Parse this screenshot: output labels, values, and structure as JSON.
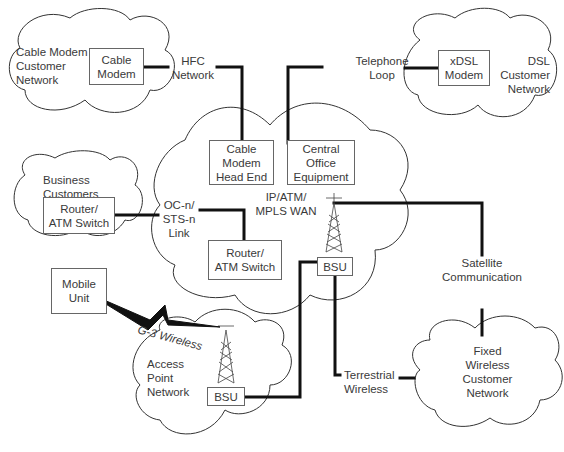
{
  "diagram": {
    "clouds": {
      "cable_modem_customer": {
        "label": [
          "Cable Modem",
          "Customer",
          "Network"
        ]
      },
      "dsl_customer": {
        "label": [
          "DSL",
          "Customer",
          "Network"
        ]
      },
      "business_customers": {
        "label": [
          "Business",
          "Customers"
        ]
      },
      "core_wan": {
        "label": [
          "IP/ATM/",
          "MPLS WAN"
        ]
      },
      "access_point": {
        "label": [
          "Access",
          "Point",
          "Network"
        ]
      },
      "fixed_wireless": {
        "label": [
          "Fixed",
          "Wireless",
          "Customer",
          "Network"
        ]
      }
    },
    "boxes": {
      "cable_modem": [
        "Cable",
        "Modem"
      ],
      "xdsl_modem": [
        "xDSL",
        "Modem"
      ],
      "cmts": [
        "Cable",
        "Modem",
        "Head End"
      ],
      "central_office": [
        "Central",
        "Office",
        "Equipment"
      ],
      "business_router": [
        "Router/",
        "ATM Switch"
      ],
      "core_router": [
        "Router/",
        "ATM Switch"
      ],
      "mobile_unit": [
        "Mobile",
        "Unit"
      ],
      "bsu_core": "BSU",
      "bsu_access": "BSU"
    },
    "links": {
      "hfc": [
        "HFC",
        "Network"
      ],
      "telephone": [
        "Telephone",
        "Loop"
      ],
      "ocn": [
        "OC-n/",
        "STS-n",
        "Link"
      ],
      "satellite": [
        "Satellite",
        "Communication"
      ],
      "g3": "G-3 Wireless",
      "terrestrial": [
        "Terrestrial",
        "Wireless"
      ]
    },
    "colors": {
      "line": "#111111",
      "outline": "#333333",
      "text": "#3a3a3a"
    }
  }
}
